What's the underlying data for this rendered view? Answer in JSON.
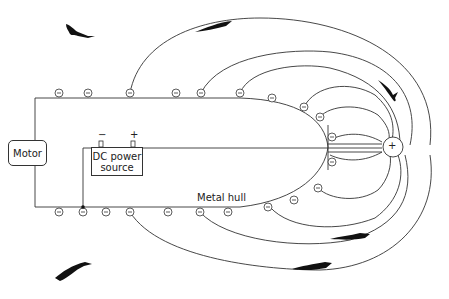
{
  "diagram": {
    "labels": {
      "motor": "Motor",
      "dc_line1": "DC power",
      "dc_line2": "source",
      "hull": "Metal hull",
      "minus_terminal": "−",
      "plus_terminal": "+",
      "anode": "+"
    },
    "icons": {
      "negative_charge": "minus-in-circle",
      "positive_electrode": "plus-in-circle",
      "fish": "fish-silhouette"
    },
    "colors": {
      "stroke": "#333333",
      "fish": "#111111",
      "background": "#ffffff"
    }
  }
}
